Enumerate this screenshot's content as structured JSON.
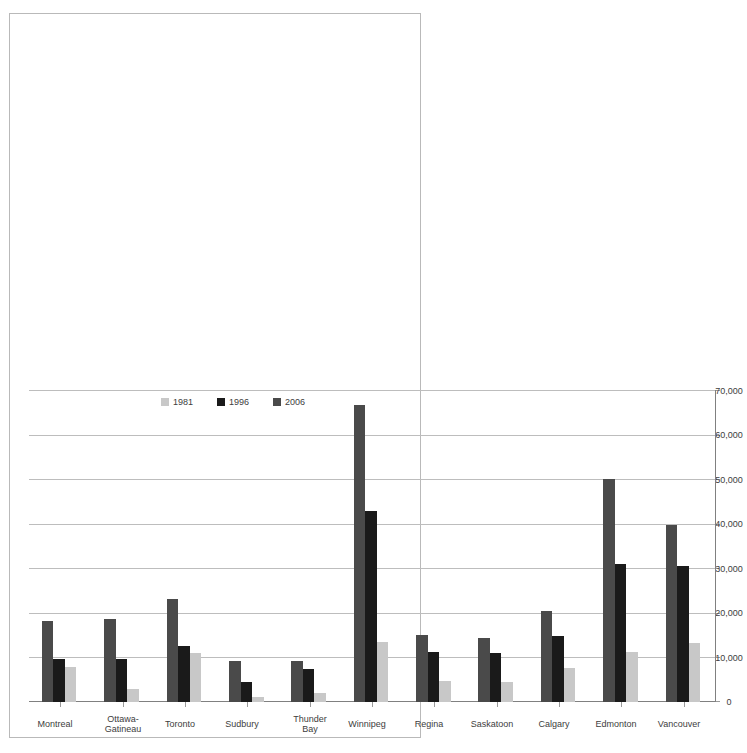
{
  "chart_data": {
    "type": "bar",
    "orientation": "horizontal",
    "title": "",
    "subtitle": "",
    "xlabel": "",
    "ylabel": "",
    "xlim": [
      0,
      70000
    ],
    "xticks": [
      0,
      10000,
      20000,
      30000,
      40000,
      50000,
      60000,
      70000
    ],
    "xtick_labels": [
      "0",
      "10,000",
      "20,000",
      "30,000",
      "40,000",
      "50,000",
      "60,000",
      "70,000"
    ],
    "grid": true,
    "grid_axis": "x",
    "legend_position": "upper-left",
    "categories": [
      "Montreal",
      "Ottawa-\nGatineau",
      "Toronto",
      "Sudbury",
      "Thunder\nBay",
      "Winnipeg",
      "Regina",
      "Saskatoon",
      "Calgary",
      "Edmonton",
      "Vancouver"
    ],
    "series": [
      {
        "name": "1981",
        "color": "#c8c8c8",
        "values": [
          7900,
          3000,
          11000,
          1200,
          2100,
          13500,
          4700,
          4500,
          7700,
          11200,
          13200
        ]
      },
      {
        "name": "1996",
        "color": "#1a1a1a",
        "values": [
          9700,
          9700,
          12600,
          4500,
          7400,
          43000,
          11200,
          11000,
          14900,
          31000,
          30500
        ]
      },
      {
        "name": "2006",
        "color": "#4a4a4a",
        "values": [
          18200,
          18600,
          23200,
          9300,
          9300,
          66800,
          15000,
          14400,
          20500,
          50200,
          39800
        ]
      }
    ]
  },
  "legend": {
    "entries": [
      {
        "label": "1981",
        "color": "#c8c8c8"
      },
      {
        "label": "1996",
        "color": "#1a1a1a"
      },
      {
        "label": "2006",
        "color": "#4a4a4a"
      }
    ]
  },
  "colors": {
    "frame": "#b9b9b9",
    "axis": "#808080",
    "grid": "#bdbdbd",
    "text": "#3d3d3d",
    "background": "#ffffff"
  }
}
